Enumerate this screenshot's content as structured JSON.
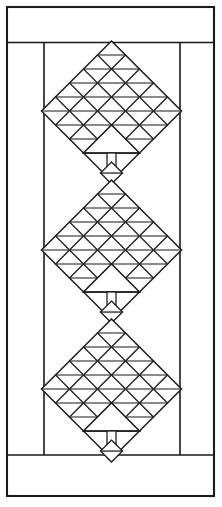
{
  "document": {
    "title": "Quilt Block Layout Diagram",
    "description": "Line-art quilt layout: three on-point basket blocks stacked vertically inside a plain border with side sashing strips",
    "background_color": "#ffffff",
    "line_color": "#1a1a1a"
  },
  "canvas": {
    "width": 222,
    "height": 507
  },
  "frame": {
    "name": "outer-border",
    "x": 7,
    "y": 7,
    "width": 207,
    "height": 489,
    "stroke_width": 2.1
  },
  "sashing": {
    "top_band_y": 42.5,
    "bottom_band_y": 455,
    "left_strip_x": 44,
    "right_strip_x": 180
  },
  "blocks": [
    {
      "name": "basket-block-top",
      "label": "Basket block 1",
      "center_x": 111.5,
      "center_y": 111,
      "half_diagonal": 70
    },
    {
      "name": "basket-block-middle",
      "label": "Basket block 2",
      "center_x": 111.5,
      "center_y": 250,
      "half_diagonal": 70
    },
    {
      "name": "basket-block-bottom",
      "label": "Basket block 3",
      "center_x": 111.5,
      "center_y": 389,
      "half_diagonal": 70
    }
  ],
  "block_pattern": {
    "grid": 5,
    "type": "half-square-triangle basket",
    "basket_rows": 2,
    "foot": {
      "stem_width": 9,
      "stem_height": 14,
      "diamond_half": 11
    }
  }
}
